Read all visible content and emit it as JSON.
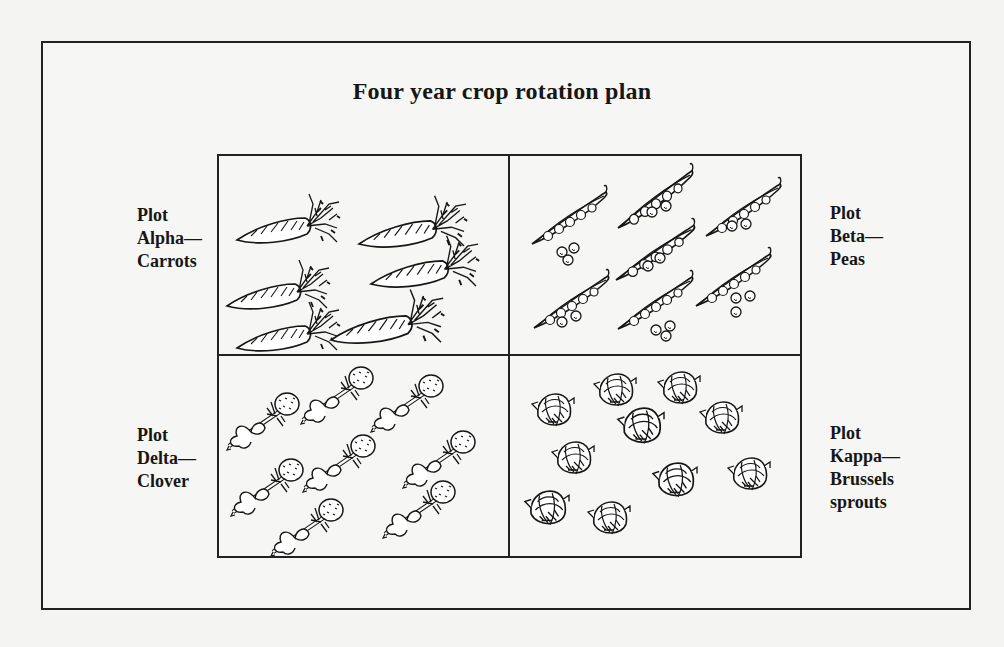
{
  "title": "Four year crop rotation plan",
  "plots": [
    {
      "position": "top-left",
      "lines": [
        "Plot",
        "Alpha—",
        "Carrots"
      ],
      "crop": "Carrots",
      "illustration": "carrot-icon",
      "count": 6
    },
    {
      "position": "top-right",
      "lines": [
        "Plot",
        "Beta—",
        "Peas"
      ],
      "crop": "Peas",
      "illustration": "pea-pod-icon",
      "count": 7
    },
    {
      "position": "bottom-left",
      "lines": [
        "Plot",
        "Delta—",
        "Clover"
      ],
      "crop": "Clover",
      "illustration": "clover-icon",
      "count": 8
    },
    {
      "position": "bottom-right",
      "lines": [
        "Plot",
        "Kappa—",
        "Brussels",
        "sprouts"
      ],
      "crop": "Brussels sprouts",
      "illustration": "brussels-sprout-icon",
      "count": 10
    }
  ],
  "colors": {
    "ink": "#161616",
    "paper": "#f4f4f2"
  }
}
